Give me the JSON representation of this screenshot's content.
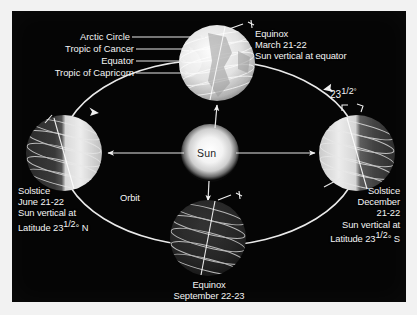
{
  "figure": {
    "background_color": "#050505",
    "panel_border_color": "#ffffff",
    "text_color": "#f4f4f4"
  },
  "center": {
    "sun_label": "Sun",
    "sun_text_color": "#1d1d1d",
    "sun_glow_color": "#ffffff"
  },
  "orbit": {
    "label": "Orbit",
    "direction": "counterclockwise"
  },
  "pointers": [
    {
      "name": "arctic-circle",
      "label": "Arctic Circle"
    },
    {
      "name": "tropic-of-cancer",
      "label": "Tropic of Cancer"
    },
    {
      "name": "equator",
      "label": "Equator"
    },
    {
      "name": "tropic-of-capricorn",
      "label": "Tropic of Capricorn"
    }
  ],
  "axis_tilt": {
    "value": "23",
    "fraction": "1/2",
    "degree": "°",
    "full": "23½°"
  },
  "positions": {
    "march": {
      "name": "march-equinox",
      "event": "Equinox",
      "date": "March 21-22",
      "note": "Sun vertical at equator",
      "illumination": "fully-lit"
    },
    "june": {
      "name": "june-solstice",
      "event": "Solstice",
      "date": "June 21-22",
      "note_line1": "Sun vertical at",
      "note_line2_prefix": "Latitude 23",
      "note_line2_frac": "1/2",
      "note_line2_suffix": "° N",
      "note_full": "Sun vertical at Latitude 23½° N",
      "illumination": "right-lit"
    },
    "september": {
      "name": "september-equinox",
      "event": "Equinox",
      "date": "September 22-23",
      "note": "Sun vertical at equator",
      "illumination": "dark"
    },
    "december": {
      "name": "december-solstice",
      "event": "Solstice",
      "date_line1": "December",
      "date_line2": "21-22",
      "note_line1": "Sun vertical at",
      "note_line2_prefix": "Latitude 23",
      "note_line2_frac": "1/2",
      "note_line2_suffix": "° S",
      "note_full": "Sun vertical at Latitude 23½° S",
      "illumination": "left-lit"
    }
  }
}
